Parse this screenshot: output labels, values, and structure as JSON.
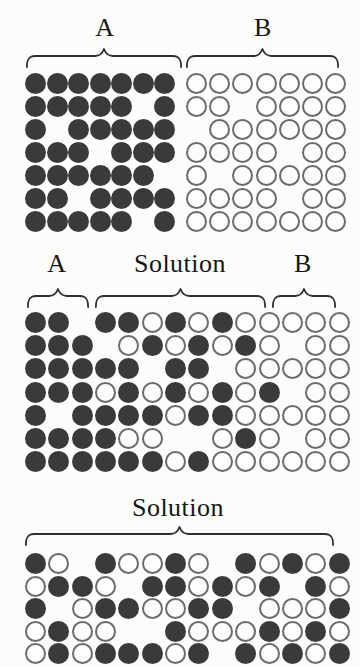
{
  "figure": {
    "background": "#fcfcfa",
    "particle_filled_color": "#3a3a3a",
    "particle_open_stroke": "#6b6b6b",
    "brace_color": "#2e2e2e",
    "text_color": "#161616"
  },
  "panels": {
    "top": {
      "label_a": "A",
      "label_b": "B",
      "rows": [
        "FFFFFFFOOOOOOO",
        "FFFFF.FOO.OOOO",
        "F.FFFFF.OOOOOO",
        "FFF.FFFOOOO.OO",
        "FFFFFF.O.OOOOO",
        "FF.FFFFOOOO.OO",
        "FFFFF.FOOOOOOO"
      ]
    },
    "middle": {
      "label_a": "A",
      "label_solution": "Solution",
      "label_b": "B",
      "rows": [
        "FF.FFOFOFOOOOO",
        "FFF.OFOFOFO.OO",
        "FFFFF.FF.OOOOO",
        "FFFOFOFOFOF.OO",
        "F.FFFFOFFOOOOO",
        "FFFFOO..OFO.OO",
        "FFFFFFOFOOOOOO"
      ]
    },
    "bottom": {
      "label_solution": "Solution",
      "rows": [
        "FO.FOOFO.FOFOF",
        "OFFO.FFOFOF.FO",
        "F.OFFOOFF.OOOF",
        "OFOO..FOOOFOFO",
        "OFOFFFOF.FOFOF"
      ]
    }
  },
  "encoding": {
    "F": "dark filled particle",
    "O": "open outlined particle",
    ".": "empty position"
  }
}
